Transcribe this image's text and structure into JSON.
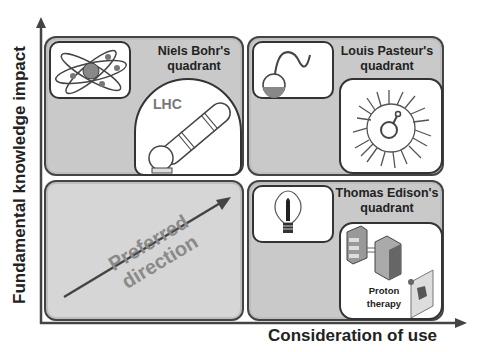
{
  "axes": {
    "y_label": "Fundamental knowledge impact",
    "x_label": "Consideration of use"
  },
  "quadrants": [
    {
      "id": "top-left",
      "title_line1": "Niels Bohr's",
      "title_line2": "quadrant",
      "icons": [
        "atom-icon",
        "lhc-icon"
      ],
      "icon_label": "LHC"
    },
    {
      "id": "top-right",
      "title_line1": "Louis Pasteur's",
      "title_line2": "quadrant",
      "icons": [
        "swan-neck-flask-icon",
        "bacteria-icon"
      ]
    },
    {
      "id": "bottom-left",
      "arrow_label_line1": "Preferred",
      "arrow_label_line2": "direction"
    },
    {
      "id": "bottom-right",
      "title_line1": "Thomas Edison's",
      "title_line2": "quadrant",
      "icons": [
        "light-bulb-icon",
        "proton-therapy-icon"
      ],
      "icon_label_line1": "Proton",
      "icon_label_line2": "therapy"
    }
  ],
  "colors": {
    "quadrant_fill": "#c9c9c9",
    "border": "#444444",
    "arrow_text": "#8a8a8a"
  }
}
